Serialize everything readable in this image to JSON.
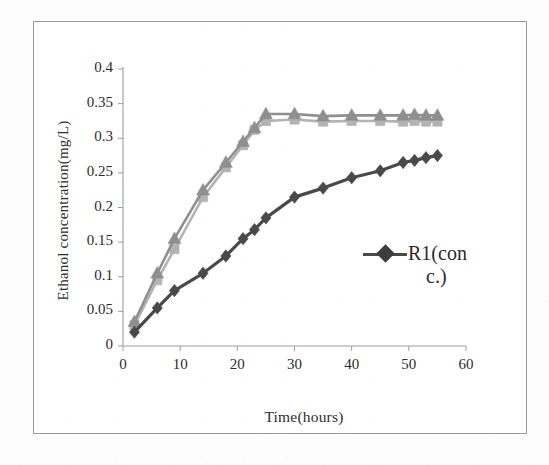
{
  "figure": {
    "kind": "scanned-line-chart"
  },
  "legend": {
    "entries": [
      {
        "label": "R1(conc.)",
        "line1": "R1(con",
        "line2": "c.)",
        "marker": "diamond-marker-icon",
        "color": "#3d3d3d"
      }
    ]
  },
  "chart_data": {
    "type": "line",
    "title": "",
    "xlabel": "Time(hours)",
    "ylabel": "Ethanol concentration(mg/L)",
    "xlim": [
      0,
      60
    ],
    "ylim": [
      0,
      0.4
    ],
    "xticks": [
      "0",
      "10",
      "20",
      "30",
      "40",
      "50",
      "60"
    ],
    "xtick_values": [
      0,
      10,
      20,
      30,
      40,
      50,
      60
    ],
    "yticks": [
      "0",
      "0.05",
      "0.1",
      "0.15",
      "0.2",
      "0.25",
      "0.3",
      "0.35",
      "0.4"
    ],
    "ytick_values": [
      0,
      0.05,
      0.1,
      0.15,
      0.2,
      0.25,
      0.3,
      0.35,
      0.4
    ],
    "grid": false,
    "legend_position": "center-right",
    "series": [
      {
        "name": "upper-triangle-series",
        "marker": "triangle",
        "color": "#8f8f8f",
        "x": [
          2,
          6,
          9,
          14,
          18,
          21,
          23,
          25,
          30,
          35,
          40,
          45,
          49,
          51,
          53,
          55
        ],
        "y": [
          0.035,
          0.105,
          0.155,
          0.225,
          0.265,
          0.295,
          0.315,
          0.335,
          0.335,
          0.332,
          0.333,
          0.333,
          0.333,
          0.334,
          0.333,
          0.333
        ]
      },
      {
        "name": "upper-square-series",
        "marker": "square",
        "color": "#b3b3b3",
        "x": [
          2,
          6,
          9,
          14,
          18,
          21,
          23,
          25,
          30,
          35,
          40,
          45,
          49,
          51,
          53,
          55
        ],
        "y": [
          0.03,
          0.095,
          0.14,
          0.215,
          0.258,
          0.29,
          0.312,
          0.325,
          0.327,
          0.324,
          0.325,
          0.325,
          0.324,
          0.325,
          0.324,
          0.324
        ]
      },
      {
        "name": "lower-diamond-series",
        "marker": "diamond",
        "color": "#4a4a4a",
        "x": [
          2,
          6,
          9,
          14,
          18,
          21,
          23,
          25,
          30,
          35,
          40,
          45,
          49,
          51,
          53,
          55
        ],
        "y": [
          0.02,
          0.055,
          0.08,
          0.105,
          0.13,
          0.155,
          0.168,
          0.185,
          0.215,
          0.228,
          0.243,
          0.253,
          0.265,
          0.268,
          0.272,
          0.275
        ]
      }
    ]
  }
}
